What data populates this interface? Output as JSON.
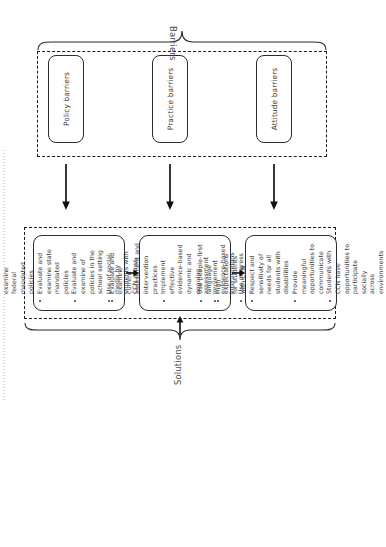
{
  "figure": {
    "orientation": "rotated-90-ccw",
    "solutions": {
      "group_label": "Solutions",
      "boxes": [
        {
          "name": "policy-solutions",
          "items": [
            "Evaluate and examine federal mandated policies",
            "Evaluate and examine state mandated policies",
            "Evaluate and examine of policies in the school setting",
            "Use of social media by students with CCN allows opportunities",
            "for policy changes"
          ],
          "continuation_indices": [
            4
          ]
        },
        {
          "name": "practice-solutions",
          "items": [
            "Evaluate and examine current assessment and intervention",
            "practices",
            "Implement effective evidence-based dynamic and ongoing",
            "assessment",
            "Implement evidence-based interventions",
            "Use progress monitoring to evaluate"
          ],
          "continuation_indices": [
            1,
            3
          ]
        },
        {
          "name": "attitude-solutions",
          "items": [
            "Use people-first language",
            "High expectations for students with CCN",
            "Respect and sensitivity of needs for all students with disabilities",
            "Provide meaningful opportunities to communicate",
            "Students with CCN have opportunities to participate socially",
            "across environments"
          ],
          "continuation_indices": [
            5
          ]
        }
      ]
    },
    "barriers": {
      "group_label": "Barriers",
      "boxes": [
        {
          "name": "policy-barriers",
          "label": "Policy barriers"
        },
        {
          "name": "practice-barriers",
          "label": "Practice barriers"
        },
        {
          "name": "attitude-barriers",
          "label": "Attitude barriers"
        }
      ]
    },
    "colors": {
      "stroke": "#2b2b2b",
      "text": "#3a3a3a",
      "label": "#4a4a4a",
      "background": "#ffffff"
    }
  }
}
